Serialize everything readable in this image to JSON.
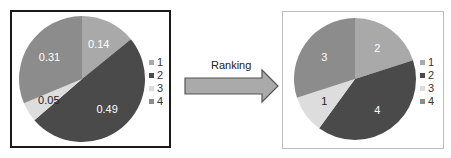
{
  "colors": {
    "series_1": "#a9a9a9",
    "series_2": "#4a4a4a",
    "series_3": "#dddddd",
    "series_4": "#8c8c8c",
    "arrow_fill": "#aaaaaa",
    "arrow_stroke": "#555555"
  },
  "arrow": {
    "label": "Ranking"
  },
  "chart_data": [
    {
      "type": "pie",
      "title": "",
      "categories": [
        "1",
        "2",
        "3",
        "4"
      ],
      "values": [
        0.14,
        0.49,
        0.05,
        0.31
      ],
      "slice_labels": [
        "0.14",
        "0.49",
        "0.05",
        "0.31"
      ],
      "legend": [
        "1",
        "2",
        "3",
        "4"
      ],
      "legend_position": "right"
    },
    {
      "type": "pie",
      "title": "",
      "categories": [
        "1",
        "2",
        "3",
        "4"
      ],
      "values": [
        2,
        4,
        1,
        3
      ],
      "slice_labels": [
        "2",
        "4",
        "1",
        "3"
      ],
      "legend": [
        "1",
        "2",
        "3",
        "4"
      ],
      "legend_position": "right"
    }
  ]
}
